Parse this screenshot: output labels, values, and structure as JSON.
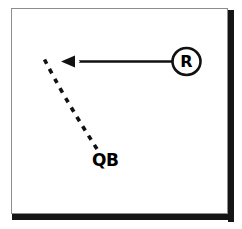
{
  "diagram": {
    "type": "football-play-diagram",
    "background_color": "#ffffff",
    "ink_color": "#000000",
    "frame": {
      "border_color": "#8d8d8d",
      "shadow_color": "#151515"
    },
    "labels": {
      "receiver": "R",
      "quarterback": "QB"
    },
    "elements": [
      {
        "name": "receiver-marker",
        "label": "R",
        "shape": "circle",
        "center": [
          186,
          61
        ],
        "radius": 14
      },
      {
        "name": "route-arrow",
        "label": "",
        "style": "solid",
        "from": [
          172,
          61
        ],
        "to": [
          62,
          61
        ],
        "arrowhead": "left"
      },
      {
        "name": "quarterback-path",
        "label": "QB",
        "style": "dashed",
        "from": [
          44,
          60
        ],
        "to": [
          97,
          150
        ]
      }
    ]
  }
}
